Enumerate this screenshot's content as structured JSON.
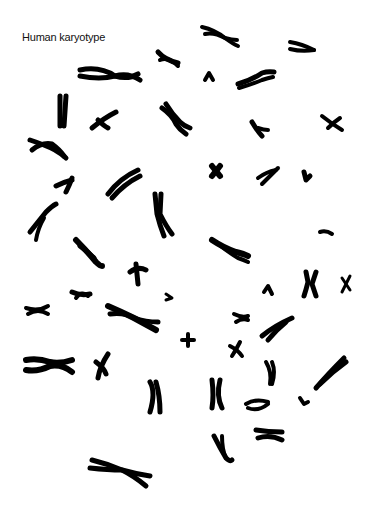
{
  "figure": {
    "title": "Human karyotype",
    "background": "#ffffff",
    "ink_color": "#000000",
    "chromosome_count_visible": 46
  }
}
